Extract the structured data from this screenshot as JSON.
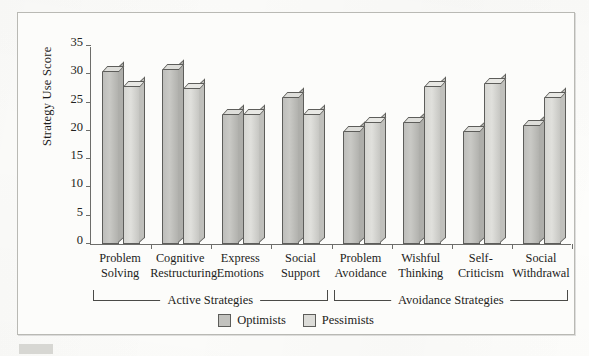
{
  "chart_data": {
    "type": "bar",
    "title": "",
    "subtitle": "",
    "xlabel": "",
    "ylabel": "Strategy Use Score",
    "ylim": [
      0,
      35
    ],
    "yticks": [
      0,
      5,
      10,
      15,
      20,
      25,
      30,
      35
    ],
    "grid": false,
    "legend_position": "bottom-center",
    "bar_style": "3d-column",
    "categories": [
      "Problem Solving",
      "Cognitive Restructuring",
      "Express Emotions",
      "Social Support",
      "Problem Avoidance",
      "Wishful Thinking",
      "Self-Criticism",
      "Social Withdrawal"
    ],
    "category_lines": [
      [
        "Problem",
        "Solving"
      ],
      [
        "Cognitive",
        "Restructuring"
      ],
      [
        "Express",
        "Emotions"
      ],
      [
        "Social",
        "Support"
      ],
      [
        "Problem",
        "Avoidance"
      ],
      [
        "Wishful",
        "Thinking"
      ],
      [
        "Self-",
        "Criticism"
      ],
      [
        "Social",
        "Withdrawal"
      ]
    ],
    "series": [
      {
        "name": "Optimists",
        "color": "#c2c2be",
        "values": [
          30.5,
          31.0,
          23.0,
          26.0,
          20.0,
          21.5,
          20.0,
          21.0
        ]
      },
      {
        "name": "Pessimists",
        "color": "#dcdcd8",
        "values": [
          28.0,
          27.5,
          23.0,
          23.0,
          21.5,
          28.0,
          28.5,
          26.0
        ]
      }
    ],
    "groups": [
      {
        "label": "Active Strategies",
        "categories": [
          0,
          1,
          2,
          3
        ]
      },
      {
        "label": "Avoidance Strategies",
        "categories": [
          4,
          5,
          6,
          7
        ]
      }
    ]
  },
  "legend": {
    "items": [
      {
        "label": "Optimists",
        "swatch": "optimists"
      },
      {
        "label": "Pessimists",
        "swatch": "pessimists"
      }
    ]
  }
}
